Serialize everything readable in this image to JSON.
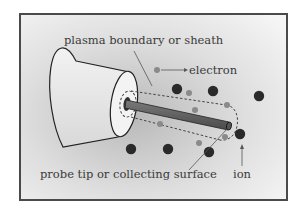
{
  "figure": {
    "labels": {
      "sheath": "plasma boundary or sheath",
      "electron": "electron",
      "probe_tip": "probe tip or collecting surface",
      "ion": "ion"
    },
    "colors": {
      "frame": "#4a4a4a",
      "background_light": "#f4f4f4",
      "background_dark": "#c8c8c8",
      "ion": "#2a2a2a",
      "electron": "#8a8a8a",
      "probe": "#6a6a6a",
      "outline": "#222222"
    },
    "particles": {
      "ions": 8,
      "electrons": 9
    }
  }
}
